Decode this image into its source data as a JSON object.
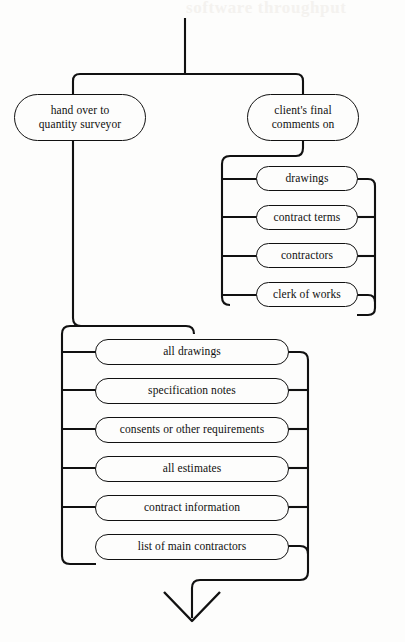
{
  "page": {
    "width": 405,
    "height": 642,
    "background_color": "#fdfdfc",
    "ink_color": "#111111",
    "ghost_text": "software throughput"
  },
  "diagram": {
    "type": "flowchart",
    "title": "",
    "entry_label": "",
    "exit_label": ""
  },
  "nodes": {
    "hand_over": {
      "line1": "hand over to",
      "line2": "quantity surveyor"
    },
    "client_final": {
      "line1": "client's final",
      "line2": "comments on"
    }
  },
  "client_comment_items": [
    {
      "label": "drawings"
    },
    {
      "label": "contract terms"
    },
    {
      "label": "contractors"
    },
    {
      "label": "clerk of works"
    }
  ],
  "handover_items": [
    {
      "label": "all drawings"
    },
    {
      "label": "specification notes"
    },
    {
      "label": "consents or other requirements"
    },
    {
      "label": "all estimates"
    },
    {
      "label": "contract information"
    },
    {
      "label": "list of main contractors"
    }
  ],
  "icons": {
    "flow_arrow": "down-arrow-icon"
  }
}
